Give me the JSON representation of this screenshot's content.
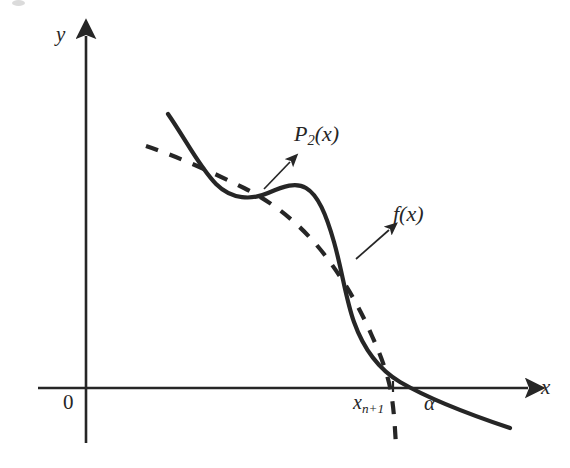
{
  "figure": {
    "kind": "math-diagram",
    "caption": "",
    "background_color": "#ffffff",
    "ink_color": "#262626"
  },
  "axes": {
    "x_label": "x",
    "y_label": "y",
    "origin_label": "0",
    "x_axis": {
      "y_px": 388,
      "x_start_px": 38,
      "x_end_px": 532,
      "arrow": "right"
    },
    "y_axis": {
      "x_px": 86,
      "y_start_px": 443,
      "y_end_px": 30,
      "arrow": "up"
    }
  },
  "ticks": [
    {
      "name": "x-sub-n-plus-1",
      "label_main": "x",
      "label_sub": "n+1",
      "x_px": 393
    },
    {
      "name": "alpha",
      "label": "α",
      "x_px": 432
    }
  ],
  "curves": [
    {
      "name": "f(x)",
      "label": "f(x)",
      "style": "solid",
      "stroke_width": 4.2,
      "description": "S-shaped decreasing function crossing the x-axis at alpha",
      "path": "M 168 114 C 186 140 200 168 216 184 C 232 200 252 200 268 193 C 284 186 296 182 306 188 C 318 195 326 214 334 242 C 342 270 346 300 354 322 C 364 350 380 370 400 382 C 424 396 462 412 510 428"
    },
    {
      "name": "P2(x)",
      "label": "P_2(x)",
      "style": "dashed",
      "stroke_width": 4.2,
      "dash_pattern": "13 12",
      "description": "Quadratic interpolant approximating f, crossing the x-axis at x_{n+1} and continuing steeply downward",
      "path": "M 146 146 C 176 156 212 172 244 188 C 276 204 302 226 324 254 C 344 280 360 308 372 336 C 382 358 388 376 391 392 C 394 410 395 428 396 446"
    }
  ],
  "annotations": [
    {
      "name": "p2-leader",
      "label": "P_2(x)",
      "from_px": [
        264,
        189
      ],
      "to_px": [
        293,
        160
      ]
    },
    {
      "name": "fx-leader",
      "label": "f(x)",
      "from_px": [
        356,
        259
      ],
      "to_px": [
        392,
        228
      ]
    }
  ],
  "labels": {
    "y_axis": "y",
    "x_axis": "x",
    "origin": "0",
    "p2_main": "P",
    "p2_sub": "2",
    "p2_tail": "(x)",
    "fx": "f(x)",
    "xn1_main": "x",
    "xn1_sub": "n+1",
    "alpha": "α"
  }
}
